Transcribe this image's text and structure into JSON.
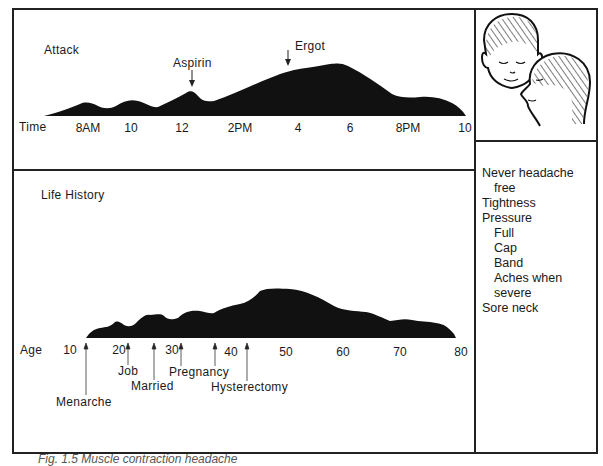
{
  "attack_panel": {
    "title": "Attack",
    "axis_label": "Time",
    "ticks": [
      "8AM",
      "10",
      "12",
      "2PM",
      "4",
      "6",
      "8PM",
      "10"
    ],
    "annotations": [
      {
        "label": "Aspirin",
        "time": "12:30"
      },
      {
        "label": "Ergot",
        "time": "3:30PM"
      }
    ]
  },
  "life_panel": {
    "title": "Life History",
    "axis_label": "Age",
    "ticks": [
      "10",
      "20",
      "30",
      "40",
      "50",
      "60",
      "70",
      "80"
    ],
    "events": [
      {
        "label": "Menarche",
        "age": 13
      },
      {
        "label": "Job",
        "age": 20
      },
      {
        "label": "Married",
        "age": 25
      },
      {
        "label": "Pregnancy",
        "age": 31
      },
      {
        "label": "Hysterectomy",
        "age": 44
      }
    ],
    "marker_ages": [
      37
    ]
  },
  "illustration": {
    "description": "Two heads (front and profile) with hatched band/cap pain distribution over scalp and neck"
  },
  "symptoms": {
    "items": [
      {
        "text": "Never headache",
        "indent": 0
      },
      {
        "text": "free",
        "indent": 2
      },
      {
        "text": "Tightness",
        "indent": 0
      },
      {
        "text": "Pressure",
        "indent": 0
      },
      {
        "text": "Full",
        "indent": 1
      },
      {
        "text": "Cap",
        "indent": 1
      },
      {
        "text": "Band",
        "indent": 1
      },
      {
        "text": "Aches when",
        "indent": 1
      },
      {
        "text": "severe",
        "indent": 1
      },
      {
        "text": "Sore neck",
        "indent": 0
      }
    ]
  },
  "caption": "Fig. 1.5 Muscle contraction headache"
}
